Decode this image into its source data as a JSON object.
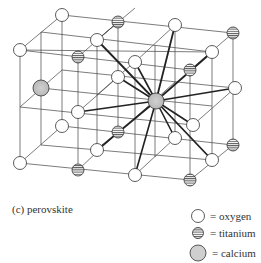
{
  "figure": {
    "caption": "(c)  perovskite",
    "legend": [
      {
        "symbol": "open-circle",
        "label": "= oxygen"
      },
      {
        "symbol": "striped-circle",
        "label": "= titanium"
      },
      {
        "symbol": "shaded-circle",
        "label": "= calcium"
      }
    ]
  },
  "colors": {
    "line": "#333333",
    "oxygen_fill": "#ffffff",
    "titanium_fill": "#ffffff",
    "calcium_fill": "#c8c8c8"
  },
  "atoms": {
    "oxygen": [
      [
        62,
        15
      ],
      [
        175,
        25
      ],
      [
        20,
        50
      ],
      [
        97,
        40
      ],
      [
        212,
        52
      ],
      [
        135,
        62
      ],
      [
        118,
        77
      ],
      [
        235,
        88
      ],
      [
        78,
        112
      ],
      [
        62,
        126
      ],
      [
        193,
        125
      ],
      [
        175,
        138
      ],
      [
        20,
        163
      ],
      [
        97,
        150
      ],
      [
        212,
        160
      ],
      [
        135,
        175
      ]
    ],
    "titanium": [
      [
        118,
        22
      ],
      [
        233,
        33
      ],
      [
        78,
        57
      ],
      [
        190,
        70
      ],
      [
        118,
        132
      ],
      [
        233,
        145
      ],
      [
        78,
        170
      ],
      [
        190,
        180
      ]
    ],
    "calcium": [
      [
        41,
        88
      ],
      [
        156,
        101
      ]
    ]
  }
}
